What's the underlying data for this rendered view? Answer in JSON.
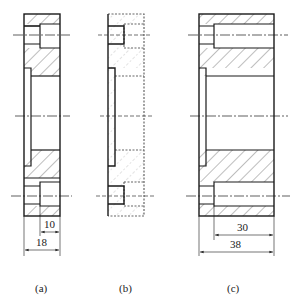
{
  "figures": [
    {
      "id": "a",
      "caption": "(a)",
      "style": "solid section with hatching",
      "dimensions": [
        {
          "label": "10",
          "meaning": "counterbore depth"
        },
        {
          "label": "18",
          "meaning": "overall width"
        }
      ]
    },
    {
      "id": "b",
      "caption": "(b)",
      "style": "dashed/phantom outline (removed material)",
      "dimensions": []
    },
    {
      "id": "c",
      "caption": "(c)",
      "style": "solid section with hatching",
      "dimensions": [
        {
          "label": "30",
          "meaning": "counterbore depth"
        },
        {
          "label": "38",
          "meaning": "overall width"
        }
      ]
    }
  ],
  "colors": {
    "line": "#1a1a1a",
    "hatch": "#333333",
    "background": "#ffffff"
  }
}
